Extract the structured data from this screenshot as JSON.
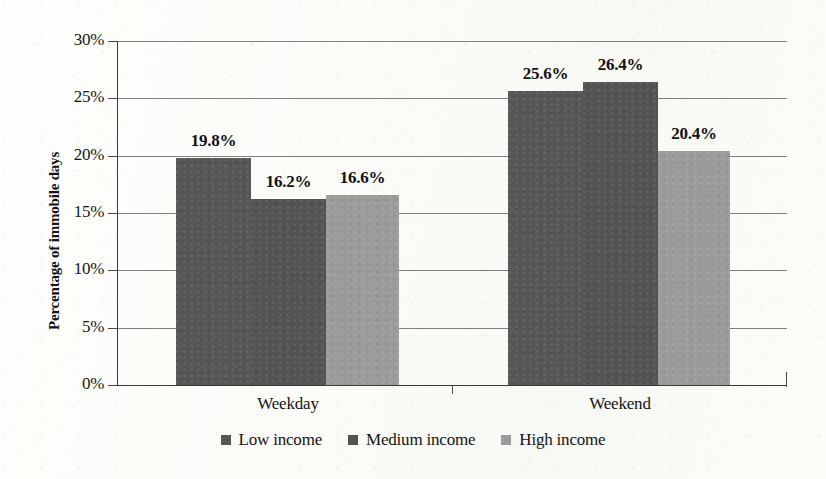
{
  "chart_data": {
    "type": "bar",
    "title": "",
    "xlabel": "",
    "ylabel": "Percentage of immobile days",
    "categories": [
      "Weekday",
      "Weekend"
    ],
    "series": [
      {
        "name": "Low income",
        "color": "#565656",
        "values": [
          19.8,
          25.6
        ],
        "labels": [
          "19.8%",
          "25.6%"
        ]
      },
      {
        "name": "Medium income",
        "color": "#535353",
        "values": [
          16.2,
          26.4
        ],
        "labels": [
          "16.2%",
          "26.4%"
        ]
      },
      {
        "name": "High income",
        "color": "#9b9b9b",
        "values": [
          16.6,
          20.4
        ],
        "labels": [
          "16.6%",
          "20.4%"
        ]
      }
    ],
    "ylim": [
      0,
      30
    ],
    "yticks": [
      0,
      5,
      10,
      15,
      20,
      25,
      30
    ],
    "ytick_labels": [
      "0%",
      "5%",
      "10%",
      "15%",
      "20%",
      "25%",
      "30%"
    ],
    "grid": true,
    "legend_position": "bottom"
  },
  "axis": {
    "y_title": "Percentage of immobile days",
    "ticks": [
      {
        "label": "30%"
      },
      {
        "label": "25%"
      },
      {
        "label": "20%"
      },
      {
        "label": "15%"
      },
      {
        "label": "10%"
      },
      {
        "label": "5%"
      },
      {
        "label": "0%"
      }
    ],
    "categories": [
      {
        "label": "Weekday"
      },
      {
        "label": "Weekend"
      }
    ]
  },
  "bars": [
    {
      "label": "19.8%"
    },
    {
      "label": "16.2%"
    },
    {
      "label": "16.6%"
    },
    {
      "label": "25.6%"
    },
    {
      "label": "26.4%"
    },
    {
      "label": "20.4%"
    }
  ],
  "legend": {
    "items": [
      {
        "label": "Low income"
      },
      {
        "label": "Medium income"
      },
      {
        "label": "High income"
      }
    ]
  }
}
